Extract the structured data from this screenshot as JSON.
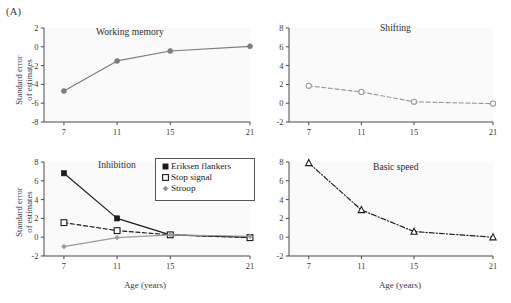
{
  "figure": {
    "panel_label": "(A)",
    "axis_titles": {
      "y_line1": "Standard error",
      "y_line2": "of estimates",
      "x": "Age (years)"
    }
  },
  "legend": {
    "items": [
      {
        "label": "Eriksen flankers",
        "marker": "filled-square",
        "color": "#1b1b1b"
      },
      {
        "label": "Stop signal",
        "marker": "open-square",
        "color": "#1b1b1b"
      },
      {
        "label": "Stroop",
        "marker": "small-diamond",
        "color": "#8d8d8d"
      }
    ]
  },
  "chart_data": [
    {
      "id": "working-memory",
      "type": "line",
      "title": "Working memory",
      "xlabel": "Age (years)",
      "ylabel": "Standard error of estimates",
      "x": [
        7,
        11,
        15,
        21
      ],
      "xticklabels": [
        "7",
        "11",
        "15",
        "21"
      ],
      "xlim": [
        5.5,
        21
      ],
      "ylim": [
        -8,
        2
      ],
      "yticks": [
        2,
        0,
        -2,
        -4,
        -6,
        -8
      ],
      "grid": false,
      "legend": "none",
      "series": [
        {
          "name": "Working memory",
          "values": [
            -4.7,
            -1.5,
            -0.45,
            0.05
          ],
          "marker": "filled-circle",
          "linestyle": "solid",
          "color": "#7c7c7c"
        }
      ]
    },
    {
      "id": "shifting",
      "type": "line",
      "title": "Shifting",
      "xlabel": "Age (years)",
      "ylabel": "Standard error of estimates",
      "x": [
        7,
        11,
        15,
        21
      ],
      "xticklabels": [
        "7",
        "11",
        "15",
        "21"
      ],
      "xlim": [
        5.5,
        21
      ],
      "ylim": [
        -2,
        8
      ],
      "yticks": [
        8,
        6,
        4,
        2,
        0,
        -2
      ],
      "grid": false,
      "legend": "none",
      "series": [
        {
          "name": "Shifting",
          "values": [
            1.85,
            1.2,
            0.15,
            -0.05
          ],
          "marker": "open-circle",
          "linestyle": "dashed",
          "color": "#9a9a9a"
        }
      ]
    },
    {
      "id": "inhibition",
      "type": "line",
      "title": "Inhibition",
      "xlabel": "Age (years)",
      "ylabel": "Standard error of estimates",
      "x": [
        7,
        11,
        15,
        21
      ],
      "xticklabels": [
        "7",
        "11",
        "15",
        "21"
      ],
      "xlim": [
        5.5,
        21
      ],
      "ylim": [
        -2,
        8
      ],
      "yticks": [
        8,
        6,
        4,
        2,
        0,
        -2
      ],
      "grid": false,
      "legend": "upper-right",
      "series": [
        {
          "name": "Eriksen flankers",
          "values": [
            6.8,
            2.0,
            0.25,
            0.0
          ],
          "marker": "filled-square",
          "linestyle": "solid",
          "color": "#1b1b1b"
        },
        {
          "name": "Stop signal",
          "values": [
            1.55,
            0.7,
            0.25,
            -0.05
          ],
          "marker": "open-square",
          "linestyle": "dashed",
          "color": "#1b1b1b"
        },
        {
          "name": "Stroop",
          "values": [
            -1.0,
            -0.05,
            0.25,
            0.1
          ],
          "marker": "small-diamond",
          "linestyle": "solid",
          "color": "#9b9b9b"
        }
      ]
    },
    {
      "id": "basic-speed",
      "type": "line",
      "title": "Basic speed",
      "xlabel": "Age (years)",
      "ylabel": "Standard error of estimates",
      "x": [
        7,
        11,
        15,
        21
      ],
      "xticklabels": [
        "7",
        "11",
        "15",
        "21"
      ],
      "xlim": [
        5.5,
        21
      ],
      "ylim": [
        -2,
        8
      ],
      "yticks": [
        8,
        6,
        4,
        2,
        0,
        -2
      ],
      "grid": false,
      "legend": "none",
      "series": [
        {
          "name": "Basic speed",
          "values": [
            7.9,
            2.9,
            0.6,
            0.0
          ],
          "marker": "open-triangle",
          "linestyle": "dashdot",
          "color": "#1b1b1b"
        }
      ]
    }
  ]
}
